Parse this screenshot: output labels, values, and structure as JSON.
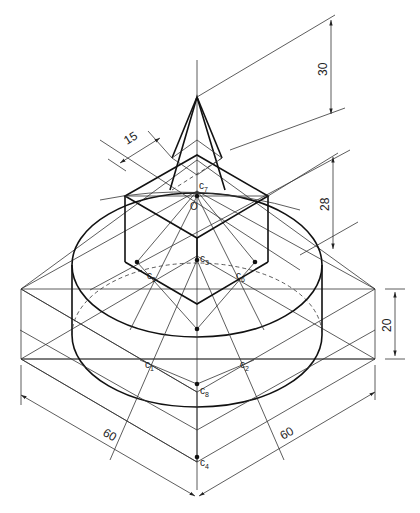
{
  "figure": {
    "type": "isometric construction drawing",
    "dimensions": {
      "pyramid_height": "30",
      "pyramid_base": "15",
      "cube_height": "28",
      "box_height": "20",
      "box_width_left": "60",
      "box_width_right": "60"
    },
    "points": {
      "origin": "O",
      "c1": {
        "base": "c",
        "sub": "1"
      },
      "c2": {
        "base": "c",
        "sub": "2"
      },
      "c3": {
        "base": "c",
        "sub": "3"
      },
      "c4": {
        "base": "c",
        "sub": "4"
      },
      "c5": {
        "base": "c",
        "sub": "5"
      },
      "c6": {
        "base": "c",
        "sub": "6"
      },
      "c7": {
        "base": "c",
        "sub": "7"
      },
      "c8": {
        "base": "c",
        "sub": "8"
      }
    },
    "colors": {
      "line": "#333333",
      "outline": "#111111",
      "background": "#ffffff"
    }
  }
}
